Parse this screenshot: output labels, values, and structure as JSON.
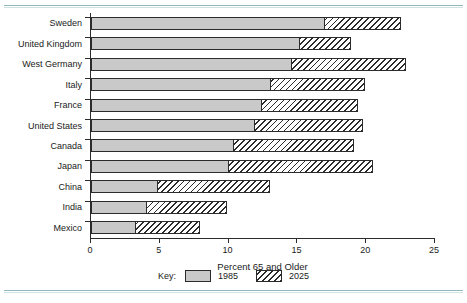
{
  "chart_data": {
    "type": "bar",
    "orientation": "horizontal",
    "stacked": true,
    "title": "",
    "xlabel": "Percent 65 and Older",
    "ylabel": "",
    "xlim": [
      0,
      25
    ],
    "xticks": [
      0,
      5,
      10,
      15,
      20,
      25
    ],
    "xticklabels": [
      "0",
      "5",
      "10",
      "15",
      "20",
      "25"
    ],
    "grid": false,
    "legend_position": "bottom",
    "legend_title": "Key:",
    "categories": [
      "Sweden",
      "United Kingdom",
      "West Germany",
      "Italy",
      "France",
      "United States",
      "Canada",
      "Japan",
      "China",
      "India",
      "Mexico"
    ],
    "series": [
      {
        "name": "1985",
        "color": "#c9c9c9",
        "values": [
          17.0,
          15.2,
          14.6,
          13.1,
          12.4,
          11.9,
          10.4,
          10.0,
          4.9,
          4.1,
          3.3
        ]
      },
      {
        "name": "2025",
        "color": "hatched",
        "values": [
          22.5,
          18.9,
          22.9,
          19.9,
          19.4,
          19.8,
          19.1,
          20.5,
          13.0,
          9.9,
          7.9
        ]
      }
    ]
  },
  "legend": {
    "title": "Key:",
    "entries": [
      {
        "label": "1985",
        "swatch": "solid-gray-swatch"
      },
      {
        "label": "2025",
        "swatch": "hatched-swatch"
      }
    ]
  },
  "axis": {
    "xlabel": "Percent 65 and Older",
    "xticklabels": [
      "0",
      "5",
      "10",
      "15",
      "20",
      "25"
    ]
  },
  "colors": {
    "bar_1985": "#c9c9c9",
    "bar_outline": "#2b2b2b",
    "rule": "#8fb9bd",
    "text": "#1a1a1a"
  }
}
